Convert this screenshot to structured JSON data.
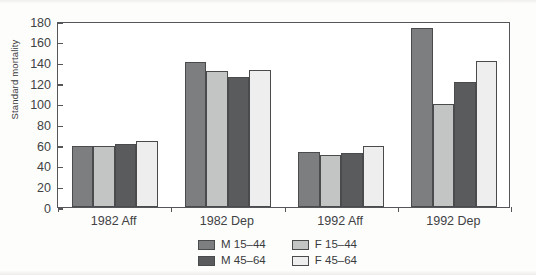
{
  "chart_data": {
    "type": "bar",
    "title": "",
    "xlabel": "",
    "ylabel": "Standard mortality",
    "ylim": [
      0,
      180
    ],
    "yticks": [
      0,
      20,
      40,
      60,
      80,
      100,
      120,
      140,
      160,
      180
    ],
    "grid": false,
    "legend_position": "bottom",
    "categories": [
      "1982 Aff",
      "1982 Dep",
      "1992 Aff",
      "1992 Dep"
    ],
    "series": [
      {
        "name": "M 15–44",
        "color": "#7d7e80",
        "values": [
          59,
          140,
          53,
          173
        ]
      },
      {
        "name": "F 15–44",
        "color": "#c3c4c4",
        "values": [
          59,
          132,
          50,
          100
        ]
      },
      {
        "name": "M 45–64",
        "color": "#5a5b5d",
        "values": [
          61,
          126,
          52,
          121
        ]
      },
      {
        "name": "F 45–64",
        "color": "#eeeeee",
        "values": [
          64,
          133,
          59,
          141
        ]
      }
    ]
  },
  "axis": {
    "y_title": "Standard mortality",
    "y_tick_labels": [
      "180",
      "160",
      "140",
      "120",
      "100",
      "80",
      "60",
      "40",
      "20",
      "0"
    ],
    "x_tick_labels": [
      "1982 Aff",
      "1982 Dep",
      "1992 Aff",
      "1992 Dep"
    ]
  },
  "legend": {
    "items": [
      {
        "label": "M 15–44",
        "color": "#7d7e80"
      },
      {
        "label": "F 15–44",
        "color": "#c3c4c4"
      },
      {
        "label": "M 45–64",
        "color": "#5a5b5d"
      },
      {
        "label": "F 45–64",
        "color": "#eeeeee"
      }
    ]
  }
}
